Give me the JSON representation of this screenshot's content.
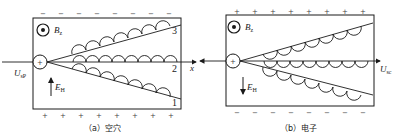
{
  "panels": [
    {
      "id": "a",
      "caption": "（a）空穴",
      "carrier": "空穴",
      "field_label": "B",
      "field_sub": "z",
      "hall_field_label": "E",
      "hall_field_sub": "H",
      "hall_field_direction": "up",
      "voltage_label": "U",
      "voltage_sub": "sP",
      "axis_label": "x",
      "top_sign": "−",
      "bottom_sign": "+",
      "source_sign": "+",
      "track_labels": [
        "3",
        "2",
        "1"
      ]
    },
    {
      "id": "b",
      "caption": "（b）电子",
      "carrier": "电子",
      "field_label": "B",
      "field_sub": "z",
      "hall_field_label": "E",
      "hall_field_sub": "H",
      "hall_field_direction": "down",
      "voltage_label": "U",
      "voltage_sub": "sc",
      "top_sign": "+",
      "bottom_sign": "−",
      "source_sign": "+"
    }
  ],
  "colors": {
    "ink": "#1a1a1a",
    "background": "#ffffff"
  }
}
